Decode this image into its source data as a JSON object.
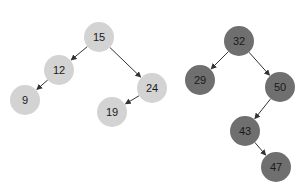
{
  "colors": {
    "background": "#ffffff",
    "tree_left_fill": "#d3d3d3",
    "tree_right_fill": "#6f6f6f",
    "edge": "#333333",
    "label": "#1a1a1a"
  },
  "trees": [
    {
      "name": "left-tree",
      "nodes": [
        {
          "id": "n15",
          "label": "15",
          "x": 99,
          "y": 37
        },
        {
          "id": "n12",
          "label": "12",
          "x": 59,
          "y": 70
        },
        {
          "id": "n9",
          "label": "9",
          "x": 25,
          "y": 100
        },
        {
          "id": "n24",
          "label": "24",
          "x": 152,
          "y": 88
        },
        {
          "id": "n19",
          "label": "19",
          "x": 112,
          "y": 112
        }
      ],
      "edges": [
        {
          "from": "n15",
          "to": "n12"
        },
        {
          "from": "n12",
          "to": "n9"
        },
        {
          "from": "n15",
          "to": "n24"
        },
        {
          "from": "n24",
          "to": "n19"
        }
      ]
    },
    {
      "name": "right-tree",
      "nodes": [
        {
          "id": "n32",
          "label": "32",
          "x": 239,
          "y": 41
        },
        {
          "id": "n29",
          "label": "29",
          "x": 200,
          "y": 80
        },
        {
          "id": "n50",
          "label": "50",
          "x": 280,
          "y": 87
        },
        {
          "id": "n43",
          "label": "43",
          "x": 245,
          "y": 131
        },
        {
          "id": "n47",
          "label": "47",
          "x": 276,
          "y": 167
        }
      ],
      "edges": [
        {
          "from": "n32",
          "to": "n29"
        },
        {
          "from": "n32",
          "to": "n50"
        },
        {
          "from": "n50",
          "to": "n43"
        },
        {
          "from": "n43",
          "to": "n47"
        }
      ]
    }
  ],
  "node_radius": 15
}
